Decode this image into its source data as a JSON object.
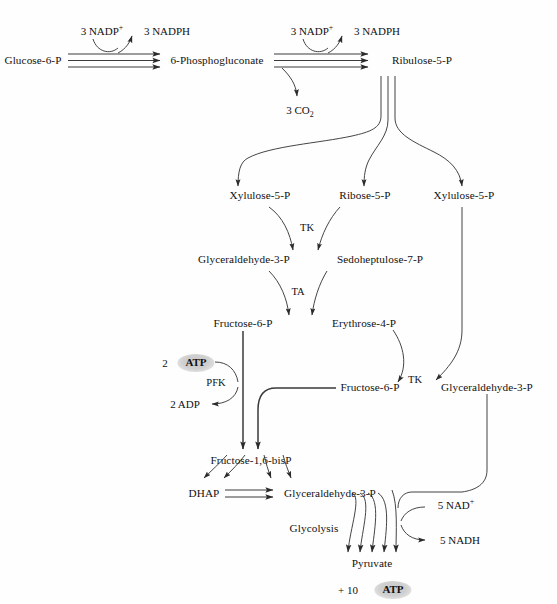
{
  "diagram": {
    "background_color": "#fefefe",
    "line_color": "#3a3a3a",
    "text_color": "#111111",
    "highlight_color": "#cfcfcf"
  },
  "metabolites": {
    "glucose_6_p": "Glucose-6-P",
    "phosphogluconate": "6-Phosphogluconate",
    "ribulose_5_p": "Ribulose-5-P",
    "xylulose_5_p_left": "Xylulose-5-P",
    "ribose_5_p": "Ribose-5-P",
    "xylulose_5_p_right": "Xylulose-5-P",
    "gap_upper_left": "Glyceraldehyde-3-P",
    "sedoheptulose_7_p": "Sedoheptulose-7-P",
    "fructose_6_p_left": "Fructose-6-P",
    "erythrose_4_p": "Erythrose-4-P",
    "fructose_6_p_mid": "Fructose-6-P",
    "gap_right": "Glyceraldehyde-3-P",
    "fructose_1_6_bisp": "Fructose-1,6-bisP",
    "dhap": "DHAP",
    "gap_lower": "Glyceraldehyde-3-P",
    "pyruvate": "Pyruvate"
  },
  "cofactors": {
    "nadp_in_1": "3 NADP",
    "nadp_in_1_charge": "+",
    "nadph_out_1": "3 NADPH",
    "nadp_in_2": "3 NADP",
    "nadp_in_2_charge": "+",
    "nadph_out_2": "3 NADPH",
    "co2": "3 CO",
    "co2_sub": "2",
    "atp_count": "2",
    "atp_label": "ATP",
    "adp": "2 ADP",
    "nad_in": "5 NAD",
    "nad_in_charge": "+",
    "nadh_out": "5 NADH",
    "atp_yield_count": "+ 10",
    "atp_yield_label": "ATP"
  },
  "enzymes": {
    "transketolase_upper": "TK",
    "transaldolase": "TA",
    "transketolase_lower": "TK",
    "phosphofructokinase": "PFK"
  },
  "process_labels": {
    "glycolysis": "Glycolysis"
  }
}
